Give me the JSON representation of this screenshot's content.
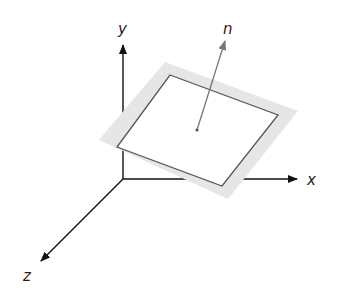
{
  "diagram": {
    "axes": {
      "x": {
        "label": "x"
      },
      "y": {
        "label": "y"
      },
      "z": {
        "label": "z"
      }
    },
    "normal": {
      "label": "n"
    },
    "colors": {
      "axis": "#111111",
      "plane_border": "#555555",
      "plane_band": "#e6e6e6",
      "plane_fill": "#ffffff",
      "normal": "#777777"
    }
  }
}
